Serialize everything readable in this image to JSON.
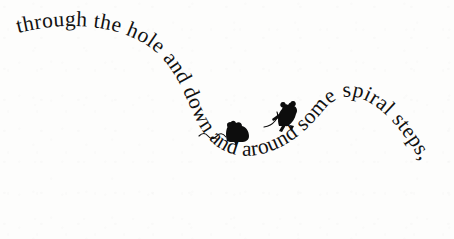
{
  "page": {
    "width": 454,
    "height": 239,
    "background_color": "#fdfdfc",
    "ink_color": "#111111",
    "medium": "printed-book-page"
  },
  "illustration": {
    "title": "curved-sentence-with-mice",
    "curved_text": {
      "full_sentence": "through the hole and down and around some spiral steps,",
      "words": [
        "through",
        "the",
        "hole",
        "and",
        "down",
        "and",
        "around",
        "some",
        "spiral",
        "steps,"
      ],
      "path_shape": "U-curve descending from upper-left, dipping through lower-middle, rising to apex at upper-right, then descending to lower-right",
      "typeface_style": "serif",
      "font_size_px": 21.5
    },
    "figures": [
      {
        "name": "mouse-left",
        "label": "mouse",
        "pose": "crouching",
        "x": 232,
        "y": 131,
        "tail_direction": "left",
        "color": "#0d0d0d"
      },
      {
        "name": "mouse-right",
        "label": "mouse",
        "pose": "rearing",
        "x": 285,
        "y": 110,
        "tail_direction": "left",
        "color": "#0d0d0d"
      }
    ]
  }
}
